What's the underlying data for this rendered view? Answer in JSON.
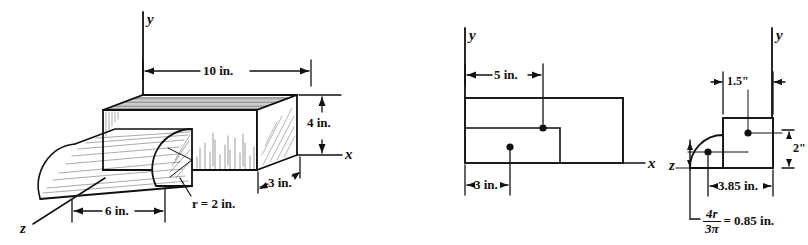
{
  "figure_set": {
    "title": "Composite solid centroid figures",
    "stroke_color": "#111111",
    "background": "#ffffff"
  },
  "figure1": {
    "name": "isometric-composite-solid",
    "axes": {
      "y_label": "y",
      "x_label": "x",
      "z_label": "z"
    },
    "dimensions": {
      "length_top": "10 in.",
      "height": "4 in.",
      "depth": "3 in.",
      "half_cyl_length": "6 in.",
      "radius": "r = 2 in."
    }
  },
  "figure2": {
    "name": "front-view-xy",
    "axes": {
      "y_label": "y",
      "x_label": "x"
    },
    "dimensions": {
      "top_centroid_x": "5 in.",
      "lower_centroid_x": "3 in."
    }
  },
  "figure3": {
    "name": "side-view-zy",
    "axes": {
      "y_label": "y",
      "z_label": "z"
    },
    "dimensions": {
      "rect_half_width": "1.5\"",
      "rect_half_height": "2\"",
      "block_centroid_z": "3.85 in.",
      "quarter_circle_centroid_label_value": "0.85 in.",
      "quarter_circle_centroid_numerator": "4r",
      "quarter_circle_centroid_denominator": "3π",
      "quarter_circle_centroid_equals": "="
    }
  }
}
